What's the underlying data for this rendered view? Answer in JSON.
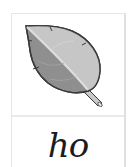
{
  "card": {
    "image": {
      "icon": "leaf-icon",
      "colors": {
        "outline": "#3a3a3a",
        "light_half": "#c4c4c4",
        "dark_half": "#8f8f8f",
        "midrib": "#dcdcdc",
        "stem": "#b8b8b8"
      }
    },
    "word": "ho"
  }
}
